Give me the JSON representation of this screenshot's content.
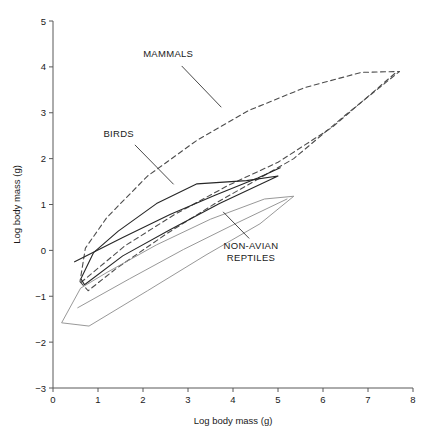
{
  "chart_data": {
    "type": "line",
    "title": "",
    "xlabel": "Log body mass (g)",
    "ylabel": "Log body mass (g)",
    "xlim": [
      0,
      8
    ],
    "ylim": [
      -3,
      5
    ],
    "xticks": [
      0,
      1,
      2,
      3,
      4,
      5,
      6,
      7,
      8
    ],
    "yticks": [
      -3,
      -2,
      -1,
      0,
      1,
      2,
      3,
      4,
      5
    ],
    "xtick_labels": [
      "0",
      "1",
      "2",
      "3",
      "4",
      "5",
      "6",
      "7",
      "8"
    ],
    "ytick_labels": [
      "−3",
      "−2",
      "−1",
      "0",
      "1",
      "2",
      "3",
      "4",
      "5"
    ],
    "grid": false,
    "legend_position": "inline-annotations",
    "series": [
      {
        "name": "MAMMALS",
        "style": "dashed",
        "color": "#4d4d4d",
        "shape": "convex-hull-polygon",
        "points": [
          [
            0.6,
            -0.68
          ],
          [
            0.78,
            -0.88
          ],
          [
            1.4,
            -0.4
          ],
          [
            2.55,
            0.38
          ],
          [
            3.6,
            1.02
          ],
          [
            4.55,
            1.55
          ],
          [
            5.35,
            2.0
          ],
          [
            6.5,
            2.95
          ],
          [
            7.7,
            3.9
          ],
          [
            6.85,
            3.88
          ],
          [
            5.6,
            3.55
          ],
          [
            4.35,
            3.05
          ],
          [
            3.2,
            2.4
          ],
          [
            2.1,
            1.62
          ],
          [
            1.2,
            0.72
          ],
          [
            0.72,
            0.05
          ]
        ]
      },
      {
        "name": "MAMMALS-median",
        "style": "dashed",
        "color": "#4d4d4d",
        "shape": "open-line",
        "points": [
          [
            0.62,
            -0.7
          ],
          [
            1.6,
            0.1
          ],
          [
            2.7,
            0.78
          ],
          [
            3.9,
            1.42
          ],
          [
            5.0,
            1.92
          ],
          [
            6.2,
            2.68
          ],
          [
            7.6,
            3.86
          ]
        ]
      },
      {
        "name": "BIRDS",
        "style": "solid",
        "color": "#262626",
        "shape": "convex-hull-polygon",
        "points": [
          [
            0.62,
            -0.62
          ],
          [
            0.7,
            -0.75
          ],
          [
            1.55,
            -0.12
          ],
          [
            2.6,
            0.45
          ],
          [
            3.7,
            1.02
          ],
          [
            5.0,
            1.62
          ],
          [
            4.3,
            1.52
          ],
          [
            3.2,
            1.45
          ],
          [
            2.3,
            1.02
          ],
          [
            1.45,
            0.42
          ],
          [
            0.9,
            -0.05
          ]
        ]
      },
      {
        "name": "BIRDS-median",
        "style": "solid",
        "color": "#262626",
        "shape": "open-line",
        "points": [
          [
            0.48,
            -0.25
          ],
          [
            1.55,
            0.28
          ],
          [
            2.6,
            0.78
          ],
          [
            3.6,
            1.2
          ],
          [
            4.55,
            1.58
          ],
          [
            5.05,
            1.8
          ]
        ]
      },
      {
        "name": "NON-AVIAN REPTILES",
        "style": "solid",
        "color": "#8c8c8c",
        "shape": "convex-hull-polygon",
        "points": [
          [
            0.2,
            -1.58
          ],
          [
            0.8,
            -1.65
          ],
          [
            2.1,
            -0.88
          ],
          [
            3.4,
            -0.1
          ],
          [
            4.6,
            0.58
          ],
          [
            5.35,
            1.18
          ],
          [
            4.7,
            1.12
          ],
          [
            3.5,
            0.68
          ],
          [
            2.3,
            0.12
          ],
          [
            1.2,
            -0.48
          ],
          [
            0.62,
            -0.82
          ]
        ]
      },
      {
        "name": "NON-AVIAN REPTILES-median",
        "style": "solid",
        "color": "#8c8c8c",
        "shape": "open-line",
        "points": [
          [
            0.55,
            -1.25
          ],
          [
            1.7,
            -0.62
          ],
          [
            2.9,
            0.02
          ],
          [
            4.05,
            0.58
          ],
          [
            5.2,
            1.12
          ]
        ]
      }
    ],
    "annotations": [
      {
        "label": "MAMMALS",
        "text_x": 2.56,
        "text_y": 4.22,
        "leader_from": [
          2.86,
          4.02
        ],
        "leader_to": [
          3.74,
          3.12
        ]
      },
      {
        "label": "BIRDS",
        "text_x": 1.46,
        "text_y": 2.48,
        "leader_from": [
          1.82,
          2.3
        ],
        "leader_to": [
          2.68,
          1.44
        ]
      },
      {
        "label": "NON-AVIAN",
        "label_line2": "REPTILES",
        "text_x": 4.4,
        "text_y": 0.02,
        "leader_from": [
          4.36,
          0.26
        ],
        "leader_to": [
          3.78,
          0.84
        ]
      }
    ],
    "colors": {
      "mammals": "#4d4d4d",
      "birds": "#262626",
      "reptiles": "#8c8c8c",
      "axis": "#595959",
      "text": "#1a1a1a",
      "background": "#ffffff"
    }
  }
}
